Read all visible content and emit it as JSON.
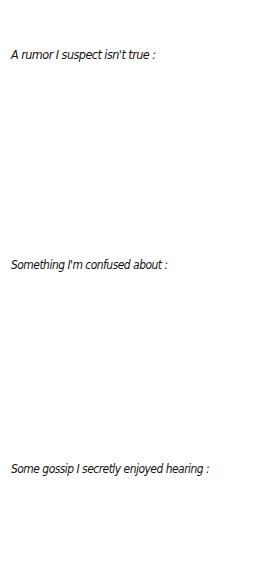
{
  "page": {
    "background_color": "#ffffff",
    "ink_color": "#141414"
  },
  "prompts": [
    {
      "label": "A rumor I suspect isn't true :",
      "response": ""
    },
    {
      "label": "Something I'm confused about :",
      "response": ""
    },
    {
      "label": "Some gossip I secretly enjoyed hearing :",
      "response": ""
    }
  ]
}
